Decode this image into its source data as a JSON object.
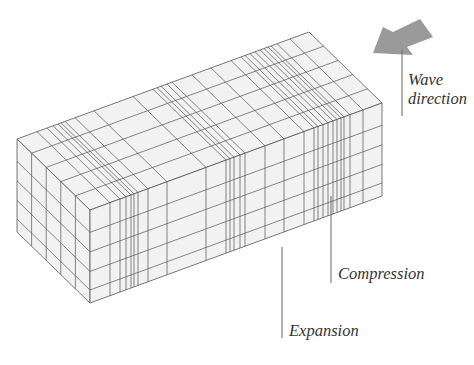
{
  "labels": {
    "wave": "Wave",
    "direction": "direction",
    "compression": "Compression",
    "expansion": "Expansion"
  },
  "colors": {
    "face_fill": "#f2f2f2",
    "grid_line": "#555555",
    "arrow_fill": "#9a9a9a",
    "leader_line": "#666666"
  },
  "box": {
    "front_top_left": [
      90,
      210
    ],
    "front_top_right": [
      382,
      103
    ],
    "height": 93,
    "depth_vector": [
      -73,
      -71
    ],
    "front_verticals_x": [
      110,
      120,
      126,
      131,
      134,
      138,
      148,
      167,
      206,
      226,
      230,
      234,
      240,
      245,
      265,
      284,
      304,
      314,
      318,
      323,
      328,
      333,
      337,
      341,
      344,
      350,
      363
    ],
    "row_fractions": [
      0.24,
      0.45,
      0.66,
      0.86
    ],
    "depth_fractions": [
      0.2,
      0.4,
      0.6,
      0.8
    ]
  },
  "arrow": {
    "points": [
      [
        373,
        53
      ],
      [
        383,
        27
      ],
      [
        393,
        32
      ],
      [
        420,
        19
      ],
      [
        433,
        37
      ],
      [
        407,
        47
      ],
      [
        413,
        55
      ]
    ]
  },
  "leaders": [
    {
      "name": "wave-direction-leader",
      "x": 402,
      "y1": 50,
      "y2": 116
    },
    {
      "name": "compression-leader",
      "x": 331,
      "y1": 196,
      "y2": 283
    },
    {
      "name": "expansion-leader",
      "x": 282,
      "y1": 247,
      "y2": 338
    }
  ]
}
